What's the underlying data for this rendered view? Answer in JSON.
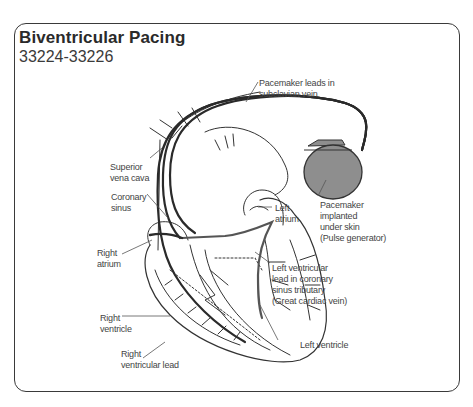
{
  "figure": {
    "title": "Biventricular Pacing",
    "code_range": "33224-33226"
  },
  "labels": {
    "pacemaker_leads": "Pacemaker leads in\nsubclavian vein",
    "superior_vena_cava": "Superior\nvena cava",
    "coronary_sinus": "Coronary\nsinus",
    "left_atrium": "Left\natrium",
    "pacemaker_implanted": "Pacemaker\nimplanted\nunder skin\n(Pulse generator)",
    "right_atrium": "Right\natrium",
    "lv_lead": "Left ventricular\nlead in coronary\nsinus tributary\n(Great cardiac vein)",
    "right_ventricle": "Right\nventricle",
    "left_ventricle": "Left ventricle",
    "rv_lead": "Right\nventricular lead"
  },
  "colors": {
    "frame": "#3a3a3a",
    "lead": "#2a2a2a",
    "pulse_generator": "#8e8e8e",
    "line_art": "#333333"
  }
}
